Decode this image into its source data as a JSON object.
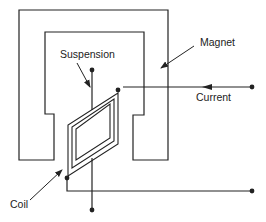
{
  "diagram": {
    "type": "moving-coil instrument schematic",
    "labels": {
      "magnet": "Magnet",
      "suspension": "Suspension",
      "current": "Current",
      "coil": "Coil"
    },
    "colors": {
      "stroke": "#222222",
      "background": "#ffffff"
    }
  }
}
